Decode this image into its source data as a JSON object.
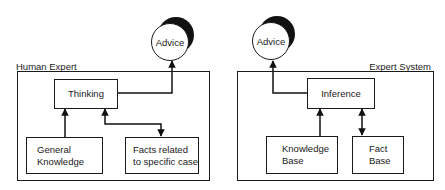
{
  "diagram": {
    "left_panel": {
      "title": "Human Expert",
      "output": "Advice",
      "center_node": "Thinking",
      "nodes": [
        {
          "label_line1": "General",
          "label_line2": "Knowledge"
        },
        {
          "label_line1": "Facts related",
          "label_line2": "to specific case"
        }
      ]
    },
    "right_panel": {
      "title": "Expert System",
      "output": "Advice",
      "center_node": "Inference",
      "nodes": [
        {
          "label_line1": "Knowledge",
          "label_line2": "Base"
        },
        {
          "label_line1": "Fact",
          "label_line2": "Base"
        }
      ]
    },
    "edges": [
      {
        "from": "General Knowledge",
        "to": "Thinking",
        "type": "one-way"
      },
      {
        "from": "Thinking",
        "to": "Facts related to specific case",
        "type": "two-way"
      },
      {
        "from": "Thinking",
        "to": "Advice",
        "type": "one-way"
      },
      {
        "from": "Knowledge Base",
        "to": "Inference",
        "type": "one-way"
      },
      {
        "from": "Inference",
        "to": "Fact Base",
        "type": "two-way"
      },
      {
        "from": "Inference",
        "to": "Advice",
        "type": "one-way"
      }
    ]
  }
}
